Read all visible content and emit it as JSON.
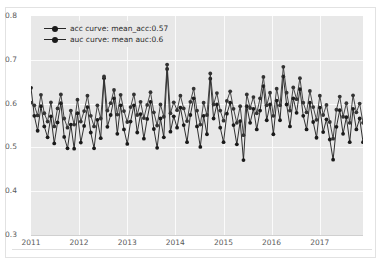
{
  "chart_data": {
    "type": "line",
    "title": "",
    "xlabel": "",
    "ylabel": "",
    "xlim": [
      2011.0,
      2017.9
    ],
    "ylim": [
      0.3,
      0.8
    ],
    "grid": true,
    "legend_position": "upper left",
    "yticks": [
      "0.8",
      "0.7",
      "0.6",
      "0.5",
      "0.4",
      "0.3"
    ],
    "ytick_values": [
      0.8,
      0.7,
      0.6,
      0.5,
      0.4,
      0.3
    ],
    "xticks": [
      "2011",
      "2012",
      "2013",
      "2014",
      "2015",
      "2016",
      "2017"
    ],
    "xtick_values": [
      2011,
      2012,
      2013,
      2014,
      2015,
      2016,
      2017
    ],
    "series": [
      {
        "name": "acc curve: mean_acc:0.57",
        "short_name": "acc curve",
        "mean": 0.57,
        "color": "#1a1a1a",
        "marker": "o",
        "values": [
          0.636,
          0.572,
          0.538,
          0.594,
          0.548,
          0.523,
          0.571,
          0.509,
          0.557,
          0.601,
          0.524,
          0.498,
          0.552,
          0.497,
          0.578,
          0.511,
          0.549,
          0.592,
          0.534,
          0.498,
          0.563,
          0.521,
          0.658,
          0.547,
          0.574,
          0.612,
          0.531,
          0.596,
          0.541,
          0.508,
          0.559,
          0.596,
          0.534,
          0.576,
          0.52,
          0.565,
          0.604,
          0.542,
          0.499,
          0.566,
          0.523,
          0.679,
          0.536,
          0.571,
          0.545,
          0.591,
          0.551,
          0.512,
          0.574,
          0.612,
          0.548,
          0.501,
          0.572,
          0.53,
          0.657,
          0.566,
          0.598,
          0.545,
          0.512,
          0.577,
          0.602,
          0.551,
          0.507,
          0.56,
          0.471,
          0.594,
          0.556,
          0.588,
          0.541,
          0.584,
          0.64,
          0.562,
          0.598,
          0.53,
          0.607,
          0.562,
          0.662,
          0.598,
          0.548,
          0.612,
          0.579,
          0.633,
          0.572,
          0.541,
          0.602,
          0.558,
          0.522,
          0.591,
          0.535,
          0.564,
          0.518,
          0.472,
          0.547,
          0.585,
          0.531,
          0.569,
          0.512,
          0.588,
          0.541,
          0.566,
          0.512
        ]
      },
      {
        "name": "auc curve: mean auc:0.6",
        "short_name": "auc curve",
        "mean": 0.6,
        "color": "#333333",
        "marker": "o",
        "values": [
          0.602,
          0.596,
          0.573,
          0.62,
          0.578,
          0.559,
          0.603,
          0.548,
          0.589,
          0.621,
          0.566,
          0.545,
          0.584,
          0.552,
          0.609,
          0.559,
          0.583,
          0.618,
          0.572,
          0.548,
          0.596,
          0.566,
          0.662,
          0.584,
          0.601,
          0.631,
          0.575,
          0.62,
          0.583,
          0.558,
          0.592,
          0.621,
          0.574,
          0.604,
          0.567,
          0.597,
          0.626,
          0.58,
          0.55,
          0.598,
          0.57,
          0.689,
          0.578,
          0.603,
          0.585,
          0.618,
          0.589,
          0.56,
          0.604,
          0.634,
          0.584,
          0.552,
          0.602,
          0.574,
          0.669,
          0.598,
          0.624,
          0.584,
          0.561,
          0.606,
          0.628,
          0.588,
          0.556,
          0.594,
          0.528,
          0.621,
          0.59,
          0.615,
          0.578,
          0.612,
          0.661,
          0.596,
          0.625,
          0.572,
          0.634,
          0.596,
          0.684,
          0.625,
          0.584,
          0.637,
          0.61,
          0.658,
          0.602,
          0.58,
          0.629,
          0.592,
          0.563,
          0.618,
          0.574,
          0.597,
          0.558,
          0.52,
          0.586,
          0.616,
          0.57,
          0.601,
          0.556,
          0.619,
          0.58,
          0.6,
          0.556
        ]
      }
    ]
  },
  "legend": {
    "items": [
      {
        "label": "acc curve: mean_acc:0.57"
      },
      {
        "label": "auc curve: mean auc:0.6"
      }
    ]
  },
  "axes": {
    "y_labels": [
      "0.8",
      "0.7",
      "0.6",
      "0.5",
      "0.4",
      "0.3"
    ],
    "x_labels": [
      "2011",
      "2012",
      "2013",
      "2014",
      "2015",
      "2016",
      "2017"
    ]
  },
  "colors": {
    "plot_background": "#e8e8e8",
    "figure_background": "#ffffff",
    "grid": "#fbfbfb",
    "series_acc": "#1a1a1a",
    "series_auc": "#333333",
    "tick_text": "#5a5a5a"
  }
}
